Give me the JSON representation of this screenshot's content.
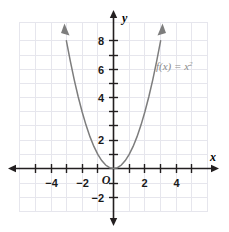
{
  "figure": {
    "title": "",
    "origin_label": "O",
    "x_axis_name": "x",
    "y_axis_name": "y",
    "function_label": "f(x) = x",
    "function_label_exponent": "2",
    "colors": {
      "grid": "#e4e4ec",
      "axis": "#231f20",
      "curve": "#7d7d7d",
      "label_text": "#1a1a1a",
      "function_label_text": "#8a8a8a",
      "background": "#ffffff"
    }
  },
  "chart_data": {
    "type": "line",
    "title": "",
    "subtitle": "",
    "xlabel": "x",
    "ylabel": "y",
    "legend": [
      "f(x) = x²"
    ],
    "legend_position": "inside-upper-right",
    "grid": true,
    "equation": "f(x) = x^2",
    "xlim": [
      -5.875,
      5.875
    ],
    "ylim": [
      -3.0,
      9.875
    ],
    "xticks": [
      -5,
      -4,
      -3,
      -2,
      -1,
      1,
      2,
      3,
      4,
      5
    ],
    "yticks": [
      -2,
      -1,
      1,
      2,
      3,
      4,
      5,
      6,
      7,
      8,
      9
    ],
    "xtick_labels": [
      {
        "value": -4,
        "text": "−4"
      },
      {
        "value": -2,
        "text": "−2"
      },
      {
        "value": 2,
        "text": "2"
      },
      {
        "value": 4,
        "text": "4"
      }
    ],
    "ytick_labels": [
      {
        "value": 8,
        "text": "8"
      },
      {
        "value": 6,
        "text": "6"
      },
      {
        "value": 4,
        "text": "4"
      },
      {
        "value": 2,
        "text": "2"
      },
      {
        "value": -2,
        "text": "−2"
      }
    ],
    "series": [
      {
        "name": "f(x) = x²",
        "x": [
          -3.0,
          -2.75,
          -2.5,
          -2.25,
          -2.0,
          -1.75,
          -1.5,
          -1.25,
          -1.0,
          -0.75,
          -0.5,
          -0.25,
          0,
          0.25,
          0.5,
          0.75,
          1.0,
          1.25,
          1.5,
          1.75,
          2.0,
          2.25,
          2.5,
          2.75,
          3.0
        ],
        "y": [
          9.0,
          7.5625,
          6.25,
          5.0625,
          4.0,
          3.0625,
          2.25,
          1.5625,
          1.0,
          0.5625,
          0.25,
          0.0625,
          0,
          0.0625,
          0.25,
          0.5625,
          1.0,
          1.5625,
          2.25,
          3.0625,
          4.0,
          5.0625,
          6.25,
          7.5625,
          9.0
        ],
        "arrow_ends": [
          "left",
          "right"
        ],
        "vertex": [
          0,
          0
        ]
      }
    ]
  }
}
